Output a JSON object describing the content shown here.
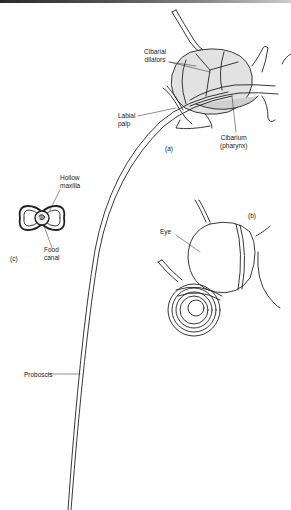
{
  "figure": {
    "panels": [
      {
        "id": "a",
        "label": "(a)",
        "description": "Head with cibarial pump"
      },
      {
        "id": "b",
        "label": "(b)",
        "description": "Head with coiled proboscis"
      },
      {
        "id": "c",
        "label": "(c)",
        "description": "Cross-section of proboscis"
      }
    ],
    "labels": {
      "cibarial_dilators_1": "Cibarial",
      "cibarial_dilators_2": "dilators",
      "labial_palp_1": "Labial",
      "labial_palp_2": "palp",
      "cibarium_1": "Cibarium",
      "cibarium_2": "(pharynx)",
      "panel_a": "(a)",
      "hollow_maxilla_1": "Hollow",
      "hollow_maxilla_2": "maxilla",
      "food_canal_1": "Food",
      "food_canal_2": "canal",
      "panel_c": "(c)",
      "panel_b": "(b)",
      "eye": "Eye",
      "proboscis": "Proboscis"
    },
    "colors": {
      "ink": "#222222",
      "shade": "#d8d8d8",
      "background": "#ffffff"
    }
  }
}
